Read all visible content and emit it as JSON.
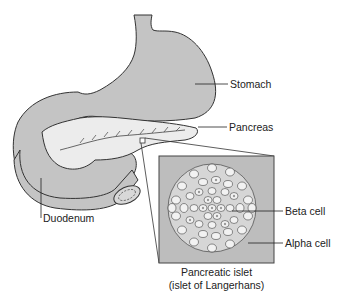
{
  "diagram": {
    "labels": {
      "stomach": "Stomach",
      "pancreas": "Pancreas",
      "duodenum": "Duodenum",
      "beta_cell": "Beta cell",
      "alpha_cell": "Alpha cell"
    },
    "inset_caption": {
      "line1": "Pancreatic islet",
      "line2": "(islet of Langerhans)"
    },
    "colors": {
      "organ_fill": "#c4c4c4",
      "pancreas_fill": "#ececec",
      "inset_fill": "#bdbdbd",
      "outline": "#333333",
      "cell_fill": "#f2f2f2",
      "cell_nucleus": "#9a9a9a"
    }
  }
}
